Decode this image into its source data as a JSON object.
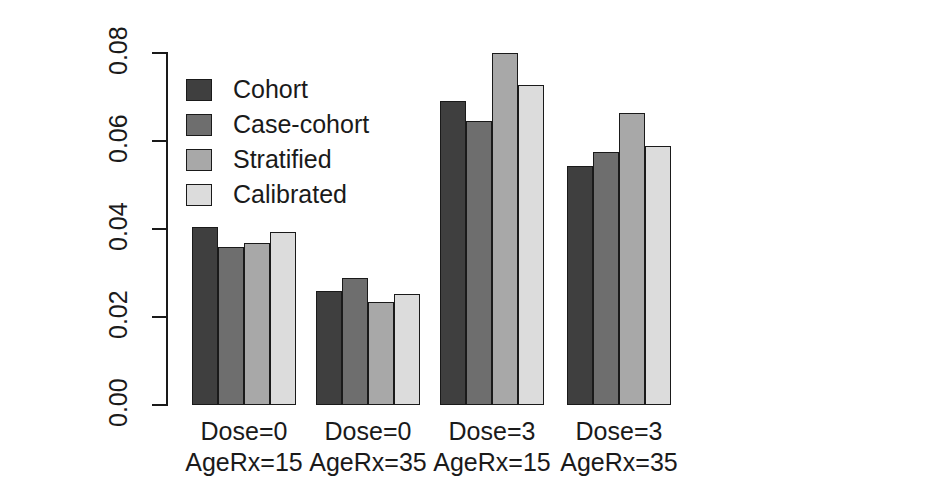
{
  "chart_data": {
    "type": "bar",
    "title": "",
    "xlabel": "",
    "ylabel": "Cumulative hazard ages 40-60 yrs",
    "ylim": [
      0.0,
      0.08
    ],
    "yticks": [
      "0.00",
      "0.02",
      "0.04",
      "0.06",
      "0.08"
    ],
    "ytick_values": [
      0.0,
      0.02,
      0.04,
      0.06,
      0.08
    ],
    "grid": false,
    "legend_position": "top-left",
    "categories": [
      "Dose=0 AgeRx=15",
      "Dose=0 AgeRx=35",
      "Dose=3 AgeRx=15",
      "Dose=3 AgeRx=35"
    ],
    "category_lines": [
      [
        "Dose=0",
        "AgeRx=15"
      ],
      [
        "Dose=0",
        "AgeRx=35"
      ],
      [
        "Dose=3",
        "AgeRx=15"
      ],
      [
        "Dose=3",
        "AgeRx=35"
      ]
    ],
    "series": [
      {
        "name": "Cohort",
        "color": "#3f3f3f",
        "values": [
          0.0405,
          0.0259,
          0.0692,
          0.0543
        ]
      },
      {
        "name": "Case-cohort",
        "color": "#6e6e6e",
        "values": [
          0.0358,
          0.0288,
          0.0645,
          0.0575
        ]
      },
      {
        "name": "Stratified",
        "color": "#a8a8a8",
        "values": [
          0.0368,
          0.0234,
          0.0801,
          0.0663
        ]
      },
      {
        "name": "Calibrated",
        "color": "#dcdcdc",
        "values": [
          0.0394,
          0.0252,
          0.0728,
          0.0588
        ]
      }
    ]
  },
  "axis": {
    "y_title": "Cumulative hazard ages 40-60 yrs"
  },
  "legend": {
    "items": [
      {
        "label": "Cohort"
      },
      {
        "label": "Case-cohort"
      },
      {
        "label": "Stratified"
      },
      {
        "label": "Calibrated"
      }
    ]
  }
}
